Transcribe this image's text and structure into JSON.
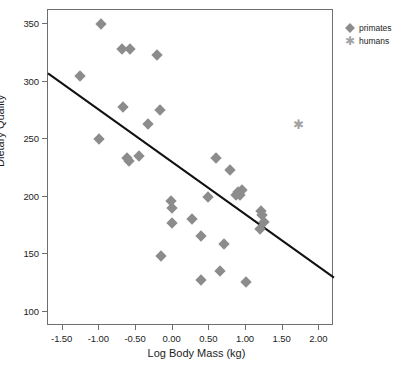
{
  "chart_data": {
    "type": "scatter",
    "title": "",
    "xlabel": "Log Body Mass (kg)",
    "ylabel": "Dietary Quality",
    "xlim": [
      -1.7,
      2.2
    ],
    "ylim": [
      88,
      362
    ],
    "grid": false,
    "legend_position": "top-right",
    "xticks": [
      -1.5,
      -1.0,
      -0.5,
      0.0,
      0.5,
      1.0,
      1.5,
      2.0
    ],
    "xtick_labels": [
      "-1.50",
      "-1.00",
      "-0.50",
      "0.00",
      "0.50",
      "1.00",
      "1.50",
      "2.00"
    ],
    "yticks": [
      100,
      150,
      200,
      250,
      300,
      350
    ],
    "ytick_labels": [
      "100",
      "150",
      "200",
      "250",
      "300",
      "350"
    ],
    "series": [
      {
        "name": "primates",
        "marker": "diamond",
        "color": "#8c8c8c",
        "points": [
          [
            -0.98,
            350
          ],
          [
            -1.27,
            305
          ],
          [
            -0.69,
            328
          ],
          [
            -0.58,
            328
          ],
          [
            -0.22,
            323
          ],
          [
            -0.68,
            278
          ],
          [
            -0.17,
            275
          ],
          [
            -0.33,
            263
          ],
          [
            -1.0,
            250
          ],
          [
            -0.62,
            234
          ],
          [
            -0.6,
            231
          ],
          [
            -0.46,
            235
          ],
          [
            0.59,
            234
          ],
          [
            0.78,
            223
          ],
          [
            0.86,
            202
          ],
          [
            0.89,
            204
          ],
          [
            0.92,
            202
          ],
          [
            0.95,
            206
          ],
          [
            0.48,
            200
          ],
          [
            -0.02,
            196
          ],
          [
            -0.01,
            190
          ],
          [
            1.2,
            188
          ],
          [
            1.22,
            184
          ],
          [
            1.25,
            178
          ],
          [
            1.19,
            172
          ],
          [
            0.26,
            181
          ],
          [
            -0.01,
            177
          ],
          [
            0.39,
            166
          ],
          [
            0.7,
            159
          ],
          [
            -0.16,
            149
          ],
          [
            0.64,
            136
          ],
          [
            0.38,
            128
          ],
          [
            1.0,
            126
          ]
        ]
      },
      {
        "name": "humans",
        "marker": "asterisk",
        "color": "#a3a3a3",
        "points": [
          [
            1.72,
            263
          ]
        ]
      }
    ],
    "trend_line": {
      "name": "fit line",
      "color": "#111111",
      "x0": -1.7,
      "y0": 307,
      "x1": 2.2,
      "y1": 130
    }
  },
  "legend": {
    "items": [
      {
        "label": "primates",
        "marker": "diamond-icon"
      },
      {
        "label": "humans",
        "marker": "asterisk-icon"
      }
    ]
  }
}
